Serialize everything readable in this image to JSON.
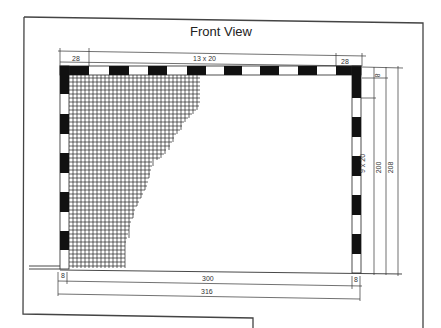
{
  "title": "Front View",
  "dimensions": {
    "top_left_corner": "28",
    "top_segments": "13 x 20",
    "top_right_corner": "28",
    "crossbar_thickness": "8",
    "side_segments": "9 x 20",
    "inner_height": "200",
    "outer_height": "208",
    "bottom_left_post": "8",
    "inner_width": "300",
    "bottom_right_post": "8",
    "outer_width": "316"
  },
  "colors": {
    "line": "#333333",
    "fill_dark": "#111111",
    "background": "#ffffff"
  }
}
